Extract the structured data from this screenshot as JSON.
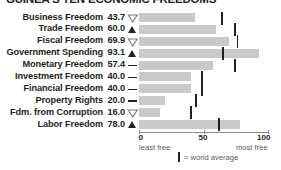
{
  "title": "GUINEA'S TEN ECONOMIC FREEDOMS",
  "colors": {
    "bar": "#c9c9c9",
    "tick": "#231f20",
    "text": "#231f20",
    "axis": "#8c8c8c",
    "subtext": "#5a5a5a"
  },
  "axis": {
    "ticks": [
      {
        "label": "0",
        "value": 0
      },
      {
        "label": "50",
        "value": 50
      },
      {
        "label": "100",
        "value": 100
      }
    ],
    "least_free": "least free",
    "most_free": "most free",
    "min": 0,
    "max": 100
  },
  "legend": {
    "marker_name": "world-average-tick",
    "label": "= world average"
  },
  "chart_data": {
    "type": "bar",
    "title": "GUINEA'S TEN ECONOMIC FREEDOMS",
    "xlabel": "",
    "ylabel": "",
    "xlim": [
      0,
      100
    ],
    "grid": false,
    "legend_position": "bottom",
    "orientation": "horizontal",
    "categories": [
      "Business Freedom",
      "Trade Freedom",
      "Fiscal Freedom",
      "Government Spending",
      "Monetary Freedom",
      "Investment Freedom",
      "Financial Freedom",
      "Property Rights",
      "Fdm. from Corruption",
      "Labor Freedom"
    ],
    "values": [
      43.7,
      60.0,
      69.9,
      93.1,
      57.4,
      40.0,
      40.0,
      20.0,
      16.0,
      78.0
    ],
    "value_labels": [
      "43.7",
      "60.0",
      "69.9",
      "93.1",
      "57.4",
      "40.0",
      "40.0",
      "20.0",
      "16.0",
      "78.0"
    ],
    "trends": [
      "down",
      "up",
      "down",
      "up",
      "flat",
      "flat",
      "flat",
      "flat",
      "down",
      "up"
    ],
    "world_average": [
      64.3,
      74.5,
      76.3,
      65.0,
      74.4,
      49.0,
      49.0,
      44.0,
      40.5,
      62.1
    ],
    "series": [
      {
        "name": "Guinea score",
        "values": [
          43.7,
          60.0,
          69.9,
          93.1,
          57.4,
          40.0,
          40.0,
          20.0,
          16.0,
          78.0
        ]
      },
      {
        "name": "world average",
        "values": [
          64.3,
          74.5,
          76.3,
          65.0,
          74.4,
          49.0,
          49.0,
          44.0,
          40.5,
          62.1
        ]
      }
    ]
  }
}
